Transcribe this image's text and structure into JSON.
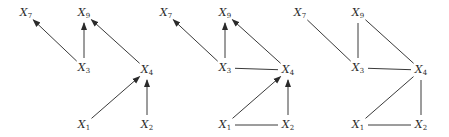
{
  "diagram": {
    "type": "graph-sequence",
    "stroke_color": "#3a3a3a",
    "graphs": [
      {
        "name": "graph-1-dag",
        "nodes": [
          {
            "id": "X7",
            "base": "X",
            "sub": "7",
            "x": 26,
            "y": 13
          },
          {
            "id": "X9",
            "base": "X",
            "sub": "9",
            "x": 84,
            "y": 13
          },
          {
            "id": "X3",
            "base": "X",
            "sub": "3",
            "x": 84,
            "y": 68
          },
          {
            "id": "X4",
            "base": "X",
            "sub": "4",
            "x": 147,
            "y": 70
          },
          {
            "id": "X1",
            "base": "X",
            "sub": "1",
            "x": 84,
            "y": 125
          },
          {
            "id": "X2",
            "base": "X",
            "sub": "2",
            "x": 147,
            "y": 125
          }
        ],
        "edges": [
          {
            "from": "X3",
            "to": "X7",
            "directed": true
          },
          {
            "from": "X3",
            "to": "X9",
            "directed": true
          },
          {
            "from": "X4",
            "to": "X9",
            "directed": true
          },
          {
            "from": "X1",
            "to": "X4",
            "directed": true
          },
          {
            "from": "X2",
            "to": "X4",
            "directed": true
          }
        ]
      },
      {
        "name": "graph-2-moralized-partial",
        "nodes": [
          {
            "id": "X7",
            "base": "X",
            "sub": "7",
            "x": 166,
            "y": 13
          },
          {
            "id": "X9",
            "base": "X",
            "sub": "9",
            "x": 225,
            "y": 13
          },
          {
            "id": "X3",
            "base": "X",
            "sub": "3",
            "x": 225,
            "y": 68
          },
          {
            "id": "X4",
            "base": "X",
            "sub": "4",
            "x": 288,
            "y": 70
          },
          {
            "id": "X1",
            "base": "X",
            "sub": "1",
            "x": 225,
            "y": 125
          },
          {
            "id": "X2",
            "base": "X",
            "sub": "2",
            "x": 288,
            "y": 125
          }
        ],
        "edges": [
          {
            "from": "X3",
            "to": "X7",
            "directed": true
          },
          {
            "from": "X3",
            "to": "X9",
            "directed": true
          },
          {
            "from": "X4",
            "to": "X9",
            "directed": true
          },
          {
            "from": "X3",
            "to": "X4",
            "directed": false
          },
          {
            "from": "X1",
            "to": "X4",
            "directed": true
          },
          {
            "from": "X2",
            "to": "X4",
            "directed": true
          },
          {
            "from": "X1",
            "to": "X2",
            "directed": false
          }
        ]
      },
      {
        "name": "graph-3-moral-undirected",
        "nodes": [
          {
            "id": "X7",
            "base": "X",
            "sub": "7",
            "x": 300,
            "y": 13
          },
          {
            "id": "X9",
            "base": "X",
            "sub": "9",
            "x": 358,
            "y": 13
          },
          {
            "id": "X3",
            "base": "X",
            "sub": "3",
            "x": 358,
            "y": 68
          },
          {
            "id": "X4",
            "base": "X",
            "sub": "4",
            "x": 421,
            "y": 70
          },
          {
            "id": "X1",
            "base": "X",
            "sub": "1",
            "x": 358,
            "y": 125
          },
          {
            "id": "X2",
            "base": "X",
            "sub": "2",
            "x": 421,
            "y": 125
          }
        ],
        "edges": [
          {
            "from": "X7",
            "to": "X3",
            "directed": false
          },
          {
            "from": "X9",
            "to": "X3",
            "directed": false
          },
          {
            "from": "X9",
            "to": "X4",
            "directed": false
          },
          {
            "from": "X3",
            "to": "X4",
            "directed": false
          },
          {
            "from": "X4",
            "to": "X1",
            "directed": false
          },
          {
            "from": "X4",
            "to": "X2",
            "directed": false
          },
          {
            "from": "X1",
            "to": "X2",
            "directed": false
          }
        ]
      }
    ]
  }
}
